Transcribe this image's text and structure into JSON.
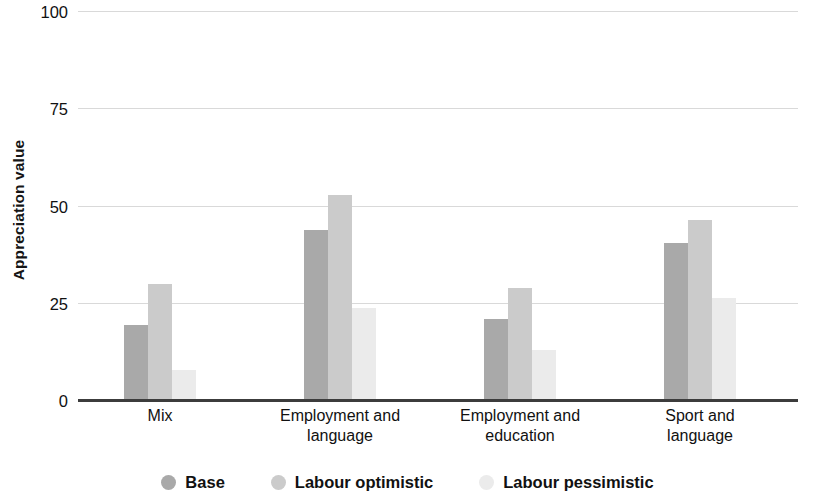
{
  "chart_data": {
    "type": "bar",
    "title": "",
    "subtitle": "",
    "xlabel": "",
    "ylabel": "Appreciation value",
    "ylim": [
      0,
      100
    ],
    "yticks": [
      0,
      25,
      50,
      75,
      100
    ],
    "ytick_labels": [
      "0",
      "25",
      "50",
      "75",
      "100"
    ],
    "grid": true,
    "legend_position": "bottom",
    "categories": [
      "Mix",
      "Employment and language",
      "Employment and education",
      "Sport and language"
    ],
    "category_lines": [
      [
        "Mix"
      ],
      [
        "Employment and",
        "language"
      ],
      [
        "Employment and",
        "education"
      ],
      [
        "Sport and",
        "language"
      ]
    ],
    "series": [
      {
        "name": "Base",
        "color": "#a9a9a9",
        "values": [
          19.5,
          44.0,
          21.0,
          40.5
        ]
      },
      {
        "name": "Labour optimistic",
        "color": "#cbcbcb",
        "values": [
          30.0,
          53.0,
          29.0,
          46.5
        ]
      },
      {
        "name": "Labour pessimistic",
        "color": "#ebebeb",
        "values": [
          8.0,
          24.0,
          13.0,
          26.5
        ]
      }
    ]
  },
  "axis": {
    "y_title": "Appreciation value",
    "grid_color": "#d9d9d9",
    "axis_color": "#3c3c3c"
  }
}
